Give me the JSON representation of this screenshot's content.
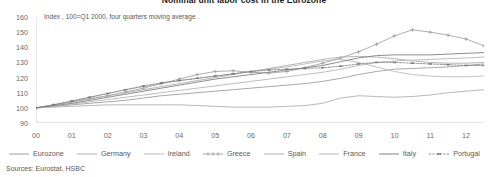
{
  "title": "Nominal unit labor cost in the Eurozone",
  "subtitle": "Index , 100=Q1 2000, four quarters moving average .",
  "sources": "Sources: Eurostat, HSBC",
  "legend": {
    "items": [
      {
        "label": "Eurozone",
        "marker": "solid-line",
        "color": "#999999"
      },
      {
        "label": "Germany",
        "marker": "solid-line",
        "color": "#aaaaaa"
      },
      {
        "label": "Ireland",
        "marker": "solid-line",
        "color": "#b5b5b5"
      },
      {
        "label": "Greece",
        "marker": "line-with-plus",
        "color": "#9a9a9a"
      },
      {
        "label": "Spain",
        "marker": "solid-line",
        "color": "#a8a8a8"
      },
      {
        "label": "France",
        "marker": "solid-line",
        "color": "#b0b0b0"
      },
      {
        "label": "Italy",
        "marker": "solid-line",
        "color": "#8f8f8f"
      },
      {
        "label": "Portugal",
        "marker": "dotted-line-with-dash",
        "color": "#777777"
      }
    ]
  },
  "chart_data": {
    "type": "line",
    "title": "Nominal unit labor cost in the Eurozone",
    "subtitle": "Index , 100=Q1 2000, four quarters moving average .",
    "xlabel": "",
    "ylabel": "Index, 100=Q1 2000",
    "ylim": [
      90,
      160
    ],
    "yticks": [
      90,
      100,
      110,
      120,
      130,
      140,
      150,
      160
    ],
    "xlim": [
      0,
      12.5
    ],
    "xticks": [
      "00",
      "01",
      "02",
      "03",
      "04",
      "05",
      "06",
      "07",
      "08",
      "09",
      "10",
      "11",
      "12"
    ],
    "grid": false,
    "legend_position": "bottom",
    "x": [
      0,
      0.5,
      1,
      1.5,
      2,
      2.5,
      3,
      3.5,
      4,
      4.5,
      5,
      5.5,
      6,
      6.5,
      7,
      7.5,
      8,
      8.5,
      9,
      9.5,
      10,
      10.5,
      11,
      11.5,
      12,
      12.5
    ],
    "series": [
      {
        "name": "Eurozone",
        "values": [
          100,
          101,
          102,
          103,
          104,
          105,
          106.5,
          108,
          109,
          110,
          111,
          112,
          113,
          114,
          115,
          116,
          117.5,
          119.5,
          122,
          124,
          125.5,
          126,
          126.5,
          127,
          128,
          129
        ]
      },
      {
        "name": "Germany",
        "values": [
          100,
          100.5,
          101,
          101.5,
          102,
          102,
          102,
          102,
          102,
          101.5,
          101,
          100.5,
          100.5,
          100.5,
          101,
          101.5,
          103,
          106.5,
          108,
          107.5,
          107,
          107.5,
          108.5,
          110,
          111,
          112
        ]
      },
      {
        "name": "Ireland",
        "values": [
          100,
          102,
          104.5,
          107,
          109.5,
          112,
          114,
          116,
          118,
          119.5,
          121,
          122.5,
          124,
          125.5,
          127,
          129,
          131,
          132,
          130,
          127,
          124,
          122,
          121,
          120.5,
          120.5,
          121
        ]
      },
      {
        "name": "Greece",
        "values": [
          100,
          102,
          104,
          106,
          108,
          110.5,
          113,
          116,
          119,
          122,
          124,
          124.5,
          123.5,
          123,
          124,
          126.5,
          129.5,
          133,
          137,
          142,
          147.5,
          151.5,
          150,
          148,
          145.5,
          141
        ]
      },
      {
        "name": "Spain",
        "values": [
          100,
          102,
          104,
          106,
          108,
          110,
          112,
          114,
          116,
          118,
          120,
          122,
          124,
          126,
          128,
          130,
          132,
          133.5,
          134,
          133.5,
          132.5,
          131,
          130,
          129.5,
          129.5,
          130
        ]
      },
      {
        "name": "France",
        "values": [
          100,
          101,
          102.5,
          104,
          105.5,
          107,
          108.5,
          110,
          111.5,
          113,
          114.5,
          116,
          117.5,
          119,
          120.5,
          122,
          123.5,
          125.5,
          128,
          130,
          131,
          131.5,
          132,
          132.5,
          133,
          133.5
        ]
      },
      {
        "name": "Italy",
        "values": [
          100,
          101.5,
          103,
          105,
          107,
          109,
          111,
          113,
          115,
          117,
          119,
          120.5,
          122,
          123.5,
          125,
          126.5,
          128,
          130.5,
          133,
          134.5,
          135,
          135,
          135,
          135.5,
          136,
          136.5
        ]
      },
      {
        "name": "Portugal",
        "values": [
          100,
          102,
          104.5,
          107,
          109.5,
          112,
          114.5,
          116.5,
          118,
          119.5,
          121,
          122.5,
          124,
          125,
          125.5,
          126,
          126.5,
          127.5,
          129,
          130,
          130,
          129.5,
          129,
          128.5,
          128,
          128
        ]
      }
    ]
  }
}
